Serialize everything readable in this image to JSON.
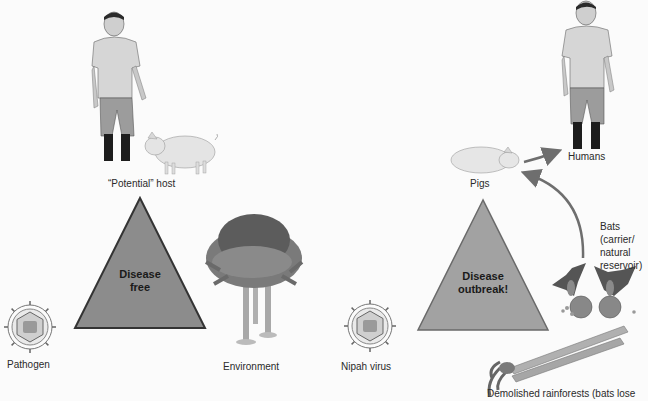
{
  "left_panel": {
    "host_label": "“Potential” host",
    "triangle_text_line1": "Disease",
    "triangle_text_line2": "free",
    "pathogen_label": "Pathogen",
    "environment_label": "Environment",
    "triangle_color": "#8c8c8c"
  },
  "right_panel": {
    "pigs_label": "Pigs",
    "humans_label": "Humans",
    "triangle_text_line1": "Disease",
    "triangle_text_line2": "outbreak!",
    "virus_label": "Nipah virus",
    "bats_label_line1": "Bats",
    "bats_label_line2": "(carrier/",
    "bats_label_line3": "natural",
    "bats_label_line4": "reservoir)",
    "rainforest_label": "Demolished rainforests (bats lose",
    "triangle_color": "#a2a2a2"
  }
}
